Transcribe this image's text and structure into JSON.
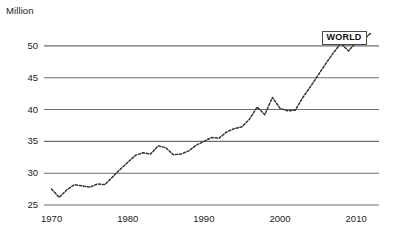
{
  "axis_unit_label": "Million",
  "series_label": "WORLD",
  "colors": {
    "gridline": "#6e6e6e",
    "dataline": "#333333",
    "text": "#1a1a1a",
    "label_box_border": "#4a4a4a",
    "background": "#ffffff"
  },
  "yticks": [
    "25",
    "30",
    "35",
    "40",
    "45",
    "50"
  ],
  "xticks": [
    "1970",
    "1980",
    "1990",
    "2000",
    "2010"
  ],
  "chart_data": {
    "type": "line",
    "title": "",
    "subtitle": "",
    "xlabel": "",
    "ylabel": "Million",
    "xlim": [
      1969,
      2013
    ],
    "ylim": [
      25,
      52.5
    ],
    "yticks": [
      25,
      30,
      35,
      40,
      45,
      50
    ],
    "xticks": [
      1970,
      1980,
      1990,
      2000,
      2010
    ],
    "grid": "horizontal",
    "legend": "inline-label-at-end",
    "line_style": "dotted",
    "annotations": [
      {
        "text": "WORLD",
        "x": 2009,
        "y": 51.2,
        "type": "series-callout-box"
      }
    ],
    "series": [
      {
        "name": "WORLD",
        "x": [
          1970,
          1971,
          1972,
          1973,
          1974,
          1975,
          1976,
          1977,
          1978,
          1979,
          1980,
          1981,
          1982,
          1983,
          1984,
          1985,
          1986,
          1987,
          1988,
          1989,
          1990,
          1991,
          1992,
          1993,
          1994,
          1995,
          1996,
          1997,
          1998,
          1999,
          2000,
          2001,
          2002,
          2003,
          2004,
          2005,
          2006,
          2007,
          2008,
          2009,
          2010,
          2011,
          2012
        ],
        "values": [
          27.5,
          26.2,
          27.4,
          28.2,
          28.0,
          27.8,
          28.3,
          28.2,
          29.4,
          30.6,
          31.7,
          32.8,
          33.2,
          33.0,
          34.3,
          34.0,
          32.9,
          33.0,
          33.5,
          34.4,
          35.0,
          35.6,
          35.5,
          36.5,
          37.0,
          37.3,
          38.5,
          40.4,
          39.2,
          41.9,
          40.2,
          39.8,
          39.9,
          41.9,
          43.6,
          45.4,
          47.2,
          48.9,
          50.4,
          49.2,
          50.6,
          51.0,
          52.1
        ]
      }
    ]
  }
}
